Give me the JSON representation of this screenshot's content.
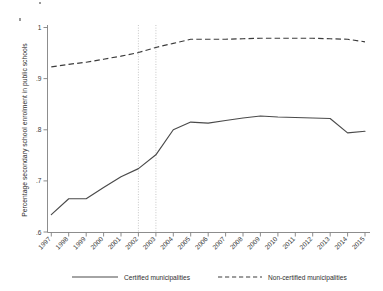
{
  "chart_data": {
    "type": "line",
    "title": "",
    "subtitle": "",
    "xlabel": "",
    "ylabel": "Percentage secondary school enrolment in public schools",
    "x": [
      1997,
      1998,
      1999,
      2000,
      2001,
      2002,
      2003,
      2004,
      2005,
      2006,
      2007,
      2008,
      2009,
      2010,
      2011,
      2012,
      2013,
      2014,
      2015
    ],
    "categories": [
      "1997",
      "1998",
      "1999",
      "2000",
      "2001",
      "2002",
      "2003",
      "2004",
      "2005",
      "2006",
      "2007",
      "2008",
      "2009",
      "2010",
      "2011",
      "2012",
      "2013",
      "2014",
      "2015"
    ],
    "series": [
      {
        "name": "Certified municipalities",
        "style": "solid",
        "color": "#4a4a4a",
        "values": [
          0.634,
          0.665,
          0.665,
          0.687,
          0.708,
          0.724,
          0.751,
          0.8,
          0.815,
          0.813,
          0.818,
          0.823,
          0.827,
          0.825,
          0.824,
          0.823,
          0.822,
          0.794,
          0.797
        ]
      },
      {
        "name": "Non-certified municipalities",
        "style": "dashed",
        "color": "#3c3c3c",
        "values": [
          0.923,
          0.928,
          0.932,
          0.938,
          0.944,
          0.951,
          0.961,
          0.969,
          0.977,
          0.977,
          0.977,
          0.978,
          0.979,
          0.979,
          0.979,
          0.979,
          0.978,
          0.977,
          0.972
        ]
      }
    ],
    "ylim": [
      0.6,
      1.0
    ],
    "yticks": [
      0.6,
      0.7,
      0.8,
      0.9,
      1.0
    ],
    "ytick_labels": [
      ".6",
      ".7",
      ".8",
      ".9",
      "1"
    ],
    "xlim": [
      1997,
      2015
    ],
    "grid": false,
    "legend_position": "bottom",
    "annotations": [
      {
        "type": "vline",
        "x": 2002,
        "style": "dotted",
        "color": "#b9b9b9"
      },
      {
        "type": "vline",
        "x": 2003,
        "style": "dotted",
        "color": "#b9b9b9"
      }
    ]
  },
  "legend": {
    "entries": [
      {
        "label": "Certified municipalities",
        "style": "solid"
      },
      {
        "label": "Non-certified municipalities",
        "style": "dashed"
      }
    ]
  }
}
